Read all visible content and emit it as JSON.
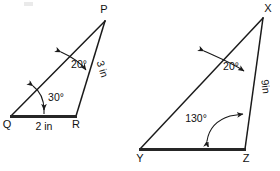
{
  "figure": {
    "background_color": "#ffffff",
    "stroke_color": "#1a1a1a",
    "base_stroke_color": "#262626"
  },
  "triangle_left": {
    "name": "triangle-pqr",
    "vertices": {
      "p": {
        "label": "P",
        "x": 105,
        "y": 20
      },
      "q": {
        "label": "Q",
        "x": 11,
        "y": 117
      },
      "r": {
        "label": "R",
        "x": 76,
        "y": 117
      }
    },
    "angles": [
      {
        "name": "angle-p",
        "label": "20°",
        "at": "P",
        "value": 20,
        "unit": "degrees"
      },
      {
        "name": "angle-q",
        "label": "30°",
        "at": "Q",
        "value": 30,
        "unit": "degrees"
      }
    ],
    "sides": [
      {
        "name": "side-qr",
        "label": "2 in",
        "from": "Q",
        "to": "R",
        "length": 2,
        "unit": "in"
      },
      {
        "name": "side-pr",
        "label": "3 in",
        "from": "P",
        "to": "R",
        "length": 3,
        "unit": "in"
      }
    ]
  },
  "triangle_right": {
    "name": "triangle-xyz",
    "vertices": {
      "x": {
        "label": "X",
        "x": 263,
        "y": 16
      },
      "y": {
        "label": "Y",
        "x": 139,
        "y": 150
      },
      "z": {
        "label": "Z",
        "x": 245,
        "y": 150
      }
    },
    "angles": [
      {
        "name": "angle-x",
        "label": "20°",
        "at": "X",
        "value": 20,
        "unit": "degrees"
      },
      {
        "name": "angle-z",
        "label": "130°",
        "at": "Z",
        "value": 130,
        "unit": "degrees"
      }
    ],
    "sides": [
      {
        "name": "side-xz",
        "label": "9in",
        "from": "X",
        "to": "Z",
        "length": 9,
        "unit": "in"
      }
    ]
  }
}
